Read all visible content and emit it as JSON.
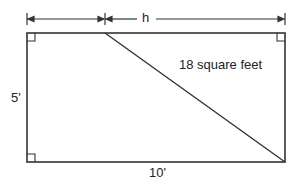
{
  "diagram": {
    "type": "geometry",
    "labels": {
      "top_dimension": "h",
      "left_side": "5'",
      "bottom_side": "10'",
      "area": "18 square feet"
    },
    "shapes": {
      "rectangle": {
        "width_label": "10'",
        "height_label": "5'"
      },
      "triangle": {
        "area_label": "18 square feet",
        "base_label": "h"
      }
    },
    "colors": {
      "stroke": "#333333",
      "background": "#ffffff"
    }
  }
}
